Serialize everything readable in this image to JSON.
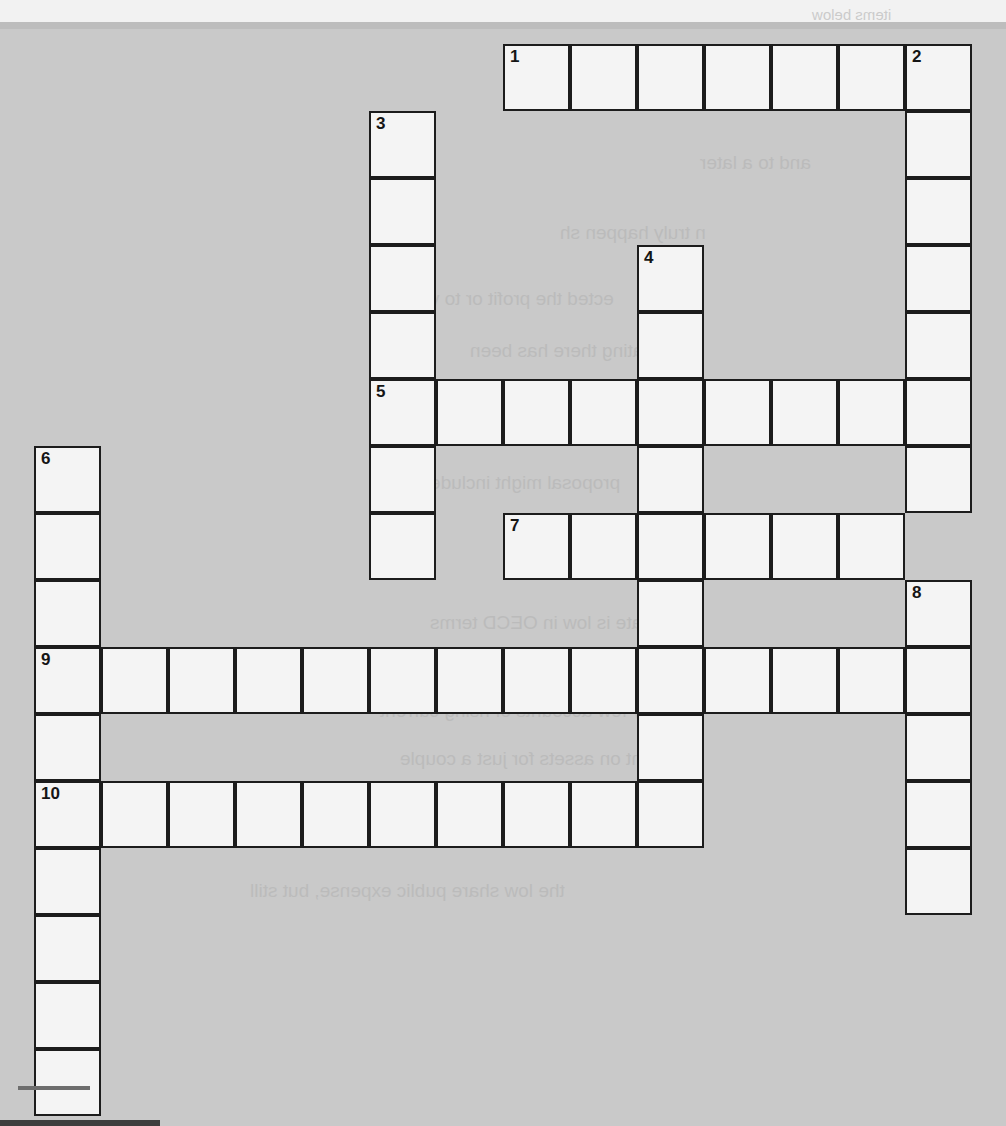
{
  "puzzle": {
    "kind": "crossword-grid",
    "columns": 14,
    "rows": 16,
    "cell_size_px": 67,
    "origin_x_px": 35,
    "origin_y_px": 45,
    "cell_fill_color": "#f4f4f4",
    "cell_border_color": "#1c1c1c",
    "page_background_color": "#c9c9c9",
    "number_color": "#151515",
    "entries": [
      {
        "number": "1",
        "direction": "across",
        "row": 0,
        "col": 7,
        "length": 7
      },
      {
        "number": "2",
        "direction": "down",
        "row": 0,
        "col": 13,
        "length": 7
      },
      {
        "number": "3",
        "direction": "down",
        "row": 1,
        "col": 5,
        "length": 7
      },
      {
        "number": "4",
        "direction": "down",
        "row": 3,
        "col": 9,
        "length": 8
      },
      {
        "number": "5",
        "direction": "across",
        "row": 5,
        "col": 5,
        "length": 9
      },
      {
        "number": "6",
        "direction": "down",
        "row": 6,
        "col": 0,
        "length": 10
      },
      {
        "number": "7",
        "direction": "across",
        "row": 7,
        "col": 7,
        "length": 6
      },
      {
        "number": "8",
        "direction": "down",
        "row": 8,
        "col": 13,
        "length": 5
      },
      {
        "number": "9",
        "direction": "across",
        "row": 9,
        "col": 0,
        "length": 14
      },
      {
        "number": "10",
        "direction": "across",
        "row": 11,
        "col": 0,
        "length": 10
      }
    ],
    "numbered_cells": [
      {
        "number": "1",
        "row": 0,
        "col": 7
      },
      {
        "number": "2",
        "row": 0,
        "col": 13
      },
      {
        "number": "3",
        "row": 1,
        "col": 5
      },
      {
        "number": "4",
        "row": 3,
        "col": 9
      },
      {
        "number": "5",
        "row": 5,
        "col": 5
      },
      {
        "number": "6",
        "row": 6,
        "col": 0
      },
      {
        "number": "7",
        "row": 7,
        "col": 7
      },
      {
        "number": "8",
        "row": 8,
        "col": 13
      },
      {
        "number": "9",
        "row": 9,
        "col": 0
      },
      {
        "number": "10",
        "row": 11,
        "col": 0
      }
    ],
    "filled_letters": []
  },
  "bleed_through_text": [
    {
      "text": "items below",
      "x": 812,
      "y": 6,
      "size": 15
    },
    {
      "text": "and to a later ",
      "x": 700,
      "y": 152,
      "size": 19
    },
    {
      "text": "n truly happen sh",
      "x": 560,
      "y": 222,
      "size": 19
    },
    {
      "text": "ected the profit or to v",
      "x": 430,
      "y": 288,
      "size": 19
    },
    {
      "text": "ating there has been",
      "x": 470,
      "y": 340,
      "size": 19
    },
    {
      "text": "on now low the costs",
      "x": 440,
      "y": 408,
      "size": 19
    },
    {
      "text": "proposal might include",
      "x": 430,
      "y": 472,
      "size": 19
    },
    {
      "text": "privacy by",
      "x": 640,
      "y": 546,
      "size": 19
    },
    {
      "text": "tax rate is low in OECD terms",
      "x": 430,
      "y": 612,
      "size": 19
    },
    {
      "text": "the",
      "x": 60,
      "y": 652,
      "size": 19
    },
    {
      "text": "ry few accounts of rising current",
      "x": 380,
      "y": 700,
      "size": 19
    },
    {
      "text": "nt on assets for just a couple",
      "x": 400,
      "y": 748,
      "size": 19
    },
    {
      "text": "the low share public expense, but still",
      "x": 250,
      "y": 880,
      "size": 19
    }
  ]
}
